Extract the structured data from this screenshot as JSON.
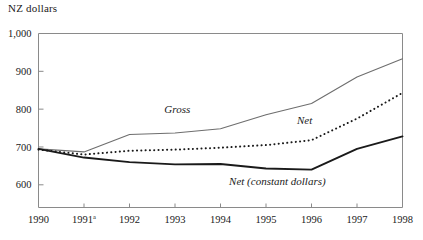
{
  "chart_data": {
    "type": "line",
    "title": "",
    "ylabel": "NZ dollars",
    "xlabel": "",
    "x": [
      "1990",
      "1991",
      "1992",
      "1993",
      "1994",
      "1995",
      "1996",
      "1997",
      "1998"
    ],
    "x_tick_labels": [
      "1990",
      "1991",
      "1992",
      "1993",
      "1994",
      "1995",
      "1996",
      "1997",
      "1998"
    ],
    "x_tick_superscripts": [
      "",
      "a",
      "",
      "",
      "",
      "",
      "",
      "",
      ""
    ],
    "y_tick_labels": [
      "600",
      "700",
      "800",
      "900",
      "1,000"
    ],
    "y_ticks": [
      600,
      700,
      800,
      900,
      1000
    ],
    "ylim": [
      540,
      1000
    ],
    "grid": false,
    "legend": "inline-labels",
    "series": [
      {
        "name": "Gross",
        "label": "Gross",
        "style": "solid-thin",
        "color": "#6e6e6e",
        "values": [
          695,
          687,
          733,
          737,
          748,
          785,
          815,
          885,
          933
        ]
      },
      {
        "name": "Net",
        "label": "Net",
        "style": "dotted",
        "color": "#1a1a1a",
        "values": [
          693,
          680,
          690,
          693,
          698,
          705,
          718,
          775,
          843
        ]
      },
      {
        "name": "Net (constant dollars)",
        "label": "Net (constant dollars)",
        "style": "solid-thick",
        "color": "#1a1a1a",
        "values": [
          695,
          672,
          660,
          654,
          655,
          643,
          640,
          695,
          728
        ]
      }
    ],
    "annotations": [
      {
        "text": "Gross",
        "x_value": 1993.05,
        "y_value": 790
      },
      {
        "text": "Net",
        "x_value": 1995.85,
        "y_value": 762
      },
      {
        "text": "Net (constant dollars)",
        "x_value": 1995.25,
        "y_value": 600
      }
    ]
  }
}
